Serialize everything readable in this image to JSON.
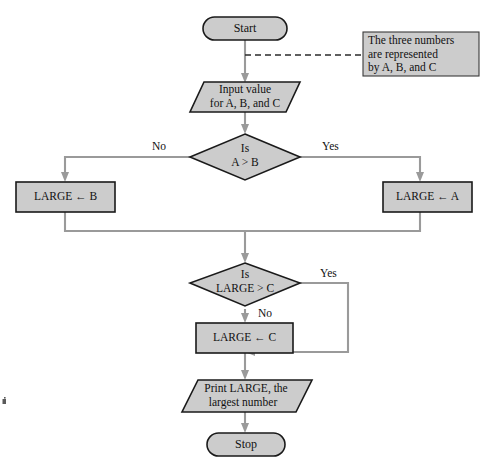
{
  "diagram": {
    "colors": {
      "node_fill": "#cccccc",
      "node_stroke": "#1a1a1a",
      "connector": "#9a9a9a",
      "background": "#ffffff"
    }
  },
  "nodes": {
    "start": {
      "label": "Start",
      "type": "terminator"
    },
    "input": {
      "line1": "Input value",
      "line2": "for A, B, and C",
      "type": "input-parallelogram"
    },
    "decision1": {
      "line1": "Is",
      "line2": "A > B",
      "type": "decision"
    },
    "large_b": {
      "label": "LARGE ← B",
      "type": "process"
    },
    "large_a": {
      "label": "LARGE ← A",
      "type": "process"
    },
    "decision2": {
      "line1": "Is",
      "line2": "LARGE > C",
      "type": "decision"
    },
    "large_c": {
      "label": "LARGE ← C",
      "type": "process"
    },
    "output": {
      "line1": "Print LARGE, the",
      "line2": "largest number",
      "type": "output-parallelogram"
    },
    "stop": {
      "label": "Stop",
      "type": "terminator"
    }
  },
  "branch_labels": {
    "d1_no": "No",
    "d1_yes": "Yes",
    "d2_yes": "Yes",
    "d2_no": "No"
  },
  "annotation": {
    "line1": "The three numbers",
    "line2": "are represented",
    "line3": "by A, B, and C"
  }
}
